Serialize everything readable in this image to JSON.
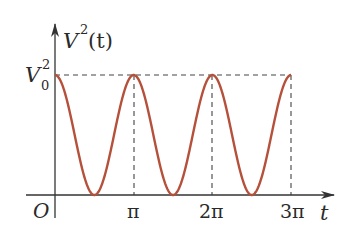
{
  "chart_data": {
    "type": "line",
    "title": "",
    "xlabel": "t",
    "ylabel": "V^2(t)",
    "origin_label": "O",
    "x_ticks": [
      {
        "value": 3.14159,
        "label": "π"
      },
      {
        "value": 6.28319,
        "label": "2π"
      },
      {
        "value": 9.42478,
        "label": "3π"
      }
    ],
    "y_ticks": [
      {
        "value": 1,
        "label": "V0^2"
      }
    ],
    "series": [
      {
        "name": "V^2(t) = V0^2 cos^2(t)",
        "color": "#b5503a",
        "x": [
          0,
          0.785,
          1.571,
          2.356,
          3.142,
          3.927,
          4.712,
          5.498,
          6.283,
          7.069,
          7.854,
          8.639,
          9.425
        ],
        "values": [
          1,
          0.5,
          0,
          0.5,
          1,
          0.5,
          0,
          0.5,
          1,
          0.5,
          0,
          0.5,
          1
        ]
      }
    ],
    "xlim": [
      0,
      10.6
    ],
    "ylim": [
      0,
      1.35
    ],
    "grid": false,
    "reference_lines": "dashed lines at y=V0^2 and at x=π, 2π, 3π",
    "legend": "none"
  },
  "labels": {
    "y_axis_V": "V",
    "y_axis_exp": "2",
    "y_axis_arg": "(t)",
    "tick_V": "V",
    "tick_sub": "0",
    "tick_sup": "2",
    "origin": "O",
    "x_axis": "t",
    "pi1": "π",
    "pi2": "2π",
    "pi3": "3π"
  },
  "colors": {
    "curve": "#b5503a",
    "axis": "#333333",
    "dash": "#444444"
  }
}
